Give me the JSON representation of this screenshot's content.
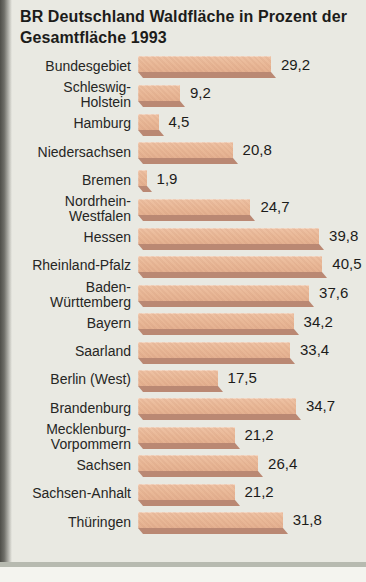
{
  "title": "BR Deutschland Waldfläche in Prozent der Gesamtfläche 1993",
  "chart_data": {
    "type": "bar",
    "orientation": "horizontal",
    "title": "BR Deutschland Waldfläche in Prozent der Gesamtfläche 1993",
    "unit": "percent",
    "xlim": [
      0,
      42
    ],
    "grid": false,
    "legend": "none",
    "categories": [
      "Bundesgebiet",
      "Schleswig-Holstein",
      "Hamburg",
      "Niedersachsen",
      "Bremen",
      "Nordrhein-Westfalen",
      "Hessen",
      "Rheinland-Pfalz",
      "Baden-Württemberg",
      "Bayern",
      "Saarland",
      "Berlin (West)",
      "Brandenburg",
      "Mecklenburg-Vorpommern",
      "Sachsen",
      "Sachsen-Anhalt",
      "Thüringen"
    ],
    "label_lines": [
      [
        "Bundesgebiet"
      ],
      [
        "Schleswig-",
        "Holstein"
      ],
      [
        "Hamburg"
      ],
      [
        "Niedersachsen"
      ],
      [
        "Bremen"
      ],
      [
        "Nordrhein-",
        "Westfalen"
      ],
      [
        "Hessen"
      ],
      [
        "Rheinland-Pfalz"
      ],
      [
        "Baden-",
        "Württemberg"
      ],
      [
        "Bayern"
      ],
      [
        "Saarland"
      ],
      [
        "Berlin (West)"
      ],
      [
        "Brandenburg"
      ],
      [
        "Mecklenburg-",
        "Vorpommern"
      ],
      [
        "Sachsen"
      ],
      [
        "Sachsen-Anhalt"
      ],
      [
        "Thüringen"
      ]
    ],
    "values": [
      29.2,
      9.2,
      4.5,
      20.8,
      1.9,
      24.7,
      39.8,
      40.5,
      37.6,
      34.2,
      33.4,
      17.5,
      34.7,
      21.2,
      26.4,
      21.2,
      31.8
    ],
    "value_labels": [
      "29,2",
      "9,2",
      "4,5",
      "20,8",
      "1,9",
      "24,7",
      "39,8",
      "40,5",
      "37,6",
      "34,2",
      "33,4",
      "17,5",
      "34,7",
      "21,2",
      "26,4",
      "21,2",
      "31,8"
    ],
    "bar_color": "#e9ba9c",
    "bar_shadow_color": "#ba8873",
    "background_color": "#e9e9e2",
    "text_color": "#1c1c1a"
  }
}
